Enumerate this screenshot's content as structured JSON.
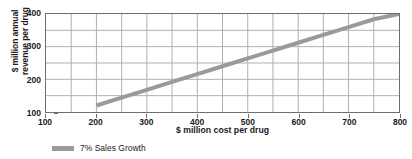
{
  "chart_data": {
    "type": "line",
    "title": "",
    "xlabel": "$ million cost per drug",
    "ylabel_line1": "$ million annual",
    "ylabel_line2": "revenue per drug",
    "xlim": [
      100,
      800
    ],
    "ylim": [
      100,
      400
    ],
    "x_major_ticks": [
      100,
      200,
      300,
      400,
      500,
      600,
      700,
      800
    ],
    "y_major_ticks": [
      100,
      200,
      300,
      400
    ],
    "x_gridlines": [
      100,
      150,
      200,
      250,
      300,
      350,
      400,
      450,
      500,
      550,
      600,
      650,
      700,
      750,
      800
    ],
    "y_gridlines": [
      100,
      150,
      200,
      250,
      300,
      350,
      400
    ],
    "grid": true,
    "legend_position": "bottom-left",
    "series": [
      {
        "name": "7% Sales Growth",
        "color": "#9a9a9a",
        "x": [
          200,
          250,
          300,
          350,
          400,
          450,
          500,
          550,
          600,
          650,
          700,
          750,
          800
        ],
        "values": [
          120,
          144,
          168,
          192,
          216,
          240,
          264,
          288,
          312,
          336,
          360,
          384,
          400
        ]
      }
    ]
  },
  "legend": {
    "items": [
      {
        "label": "7% Sales Growth",
        "color": "#9a9a9a"
      }
    ]
  },
  "colors": {
    "series": "#9a9a9a",
    "axis": "#6e6e6e",
    "grid": "#b0b0b0",
    "text": "#1a1a1a",
    "background": "#ffffff"
  }
}
